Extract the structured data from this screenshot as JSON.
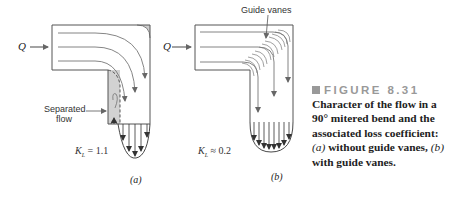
{
  "figure": {
    "number_label": "FIGURE 8.31",
    "caption_parts": {
      "p1": "Character of the flow in a 90° mitered bend and the associated loss coefficient: ",
      "a": "(a)",
      "p2": " without guide vanes, ",
      "b": "(b)",
      "p3": " with guide vanes."
    }
  },
  "panel_a": {
    "inflow_label": "Q",
    "annotation": "Separated flow",
    "annotation_line1": "Separated",
    "annotation_line2": "flow",
    "kl_symbol": "K",
    "kl_sub": "L",
    "kl_value": "= 1.1",
    "sublabel": "(a)"
  },
  "panel_b": {
    "inflow_label": "Q",
    "annotation": "Guide vanes",
    "kl_symbol": "K",
    "kl_sub": "L",
    "kl_value": "≈ 0.2",
    "sublabel": "(b)"
  },
  "colors": {
    "outline": "#555555",
    "streamline": "#777777",
    "separated_region": "#d4d4d4",
    "caption_head": "#999999",
    "caption_text": "#222222"
  }
}
